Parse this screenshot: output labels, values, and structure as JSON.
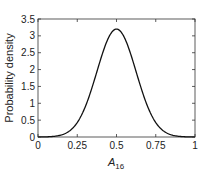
{
  "chart_data": {
    "type": "line",
    "title": "",
    "xlabel": "A",
    "xlabel_subscript": "16",
    "ylabel": "Probability density",
    "xlim": [
      0,
      1
    ],
    "ylim": [
      0,
      3.5
    ],
    "xticks": [
      0,
      0.25,
      0.5,
      0.75,
      1
    ],
    "xtick_labels": [
      "0",
      "0.25",
      "0.5",
      "0.75",
      "1"
    ],
    "yticks": [
      0,
      0.5,
      1,
      1.5,
      2,
      2.5,
      3,
      3.5
    ],
    "ytick_labels": [
      "0",
      "0.5",
      "1",
      "1.5",
      "2",
      "2.5",
      "3",
      "3.5"
    ],
    "grid": false,
    "legend": null,
    "series": [
      {
        "name": "density",
        "color": "#111111",
        "x": [
          0,
          0.05,
          0.1,
          0.15,
          0.2,
          0.25,
          0.3,
          0.35,
          0.4,
          0.45,
          0.5,
          0.55,
          0.6,
          0.65,
          0.7,
          0.75,
          0.8,
          0.85,
          0.9,
          0.95,
          1
        ],
        "y": [
          0,
          0.0,
          0.02,
          0.09,
          0.29,
          0.68,
          1.27,
          1.97,
          2.62,
          3.05,
          3.2,
          3.05,
          2.62,
          1.97,
          1.27,
          0.68,
          0.29,
          0.09,
          0.02,
          0.0,
          0
        ]
      }
    ]
  }
}
